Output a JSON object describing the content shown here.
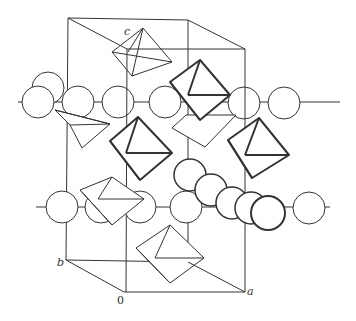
{
  "figure": {
    "axis_labels": {
      "a": "a",
      "b": "b",
      "c": "c",
      "origin": "0"
    },
    "colors": {
      "line": "#333333",
      "background": "#ffffff"
    },
    "sphere_rows": [
      {
        "name": "upper-row",
        "y": 102,
        "count": 6
      },
      {
        "name": "lower-row",
        "y": 207,
        "count": 6
      }
    ],
    "highlighted_chain": {
      "name": "diagonal-sphere-chain",
      "count": 5
    },
    "bold_octahedra_count": 3
  }
}
